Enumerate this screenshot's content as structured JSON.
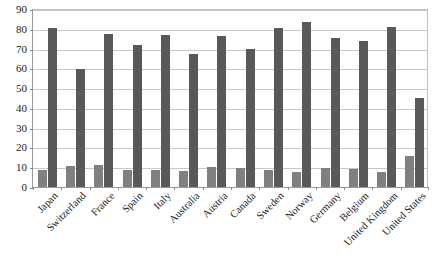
{
  "chart_data": {
    "type": "bar",
    "title": "",
    "subtitle": "",
    "xlabel": "",
    "ylabel": "",
    "ylim": [
      0,
      90
    ],
    "yticks": [
      0,
      10,
      20,
      30,
      40,
      50,
      60,
      70,
      80,
      90
    ],
    "grid": true,
    "legend": "none",
    "orientation": "vertical",
    "categories": [
      "Japan",
      "Switzerland",
      "France",
      "Spain",
      "Italy",
      "Australia",
      "Austria",
      "Canada",
      "Sweden",
      "Norway",
      "Germany",
      "Belgium",
      "United Kingdom",
      "United States"
    ],
    "series": [
      {
        "name": "series-1",
        "color": "#808080",
        "values": [
          8.5,
          10.5,
          11,
          8.5,
          8.5,
          8,
          10,
          9.5,
          8.5,
          7.5,
          9.5,
          9,
          7.5,
          15.5
        ]
      },
      {
        "name": "series-2",
        "color": "#595959",
        "values": [
          80.5,
          59.5,
          77.5,
          72,
          77,
          67.5,
          76.5,
          70,
          80.5,
          83.5,
          75.5,
          74,
          81,
          45
        ]
      }
    ]
  },
  "axis": {
    "y_tick_labels": [
      "90",
      "80",
      "70",
      "60",
      "50",
      "40",
      "30",
      "20",
      "10",
      "0"
    ]
  }
}
